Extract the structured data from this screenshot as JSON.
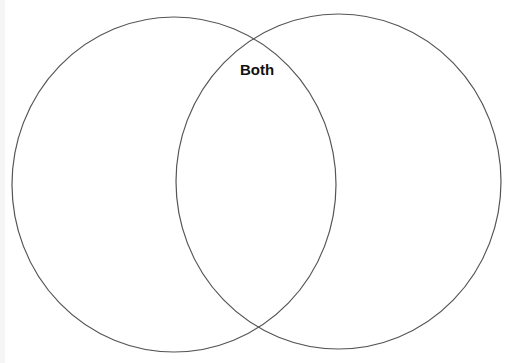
{
  "diagram": {
    "type": "venn",
    "stroke_color": "#555555",
    "background": "#ffffff",
    "sets": [
      {
        "id": "left",
        "label": "",
        "cx": 174,
        "cy": 184.5,
        "rx": 162,
        "ry": 167.5
      },
      {
        "id": "right",
        "label": "",
        "cx": 338.5,
        "cy": 181.5,
        "rx": 162.5,
        "ry": 167.5
      }
    ],
    "intersection": {
      "label": "Both",
      "x": 240,
      "y": 62
    }
  }
}
